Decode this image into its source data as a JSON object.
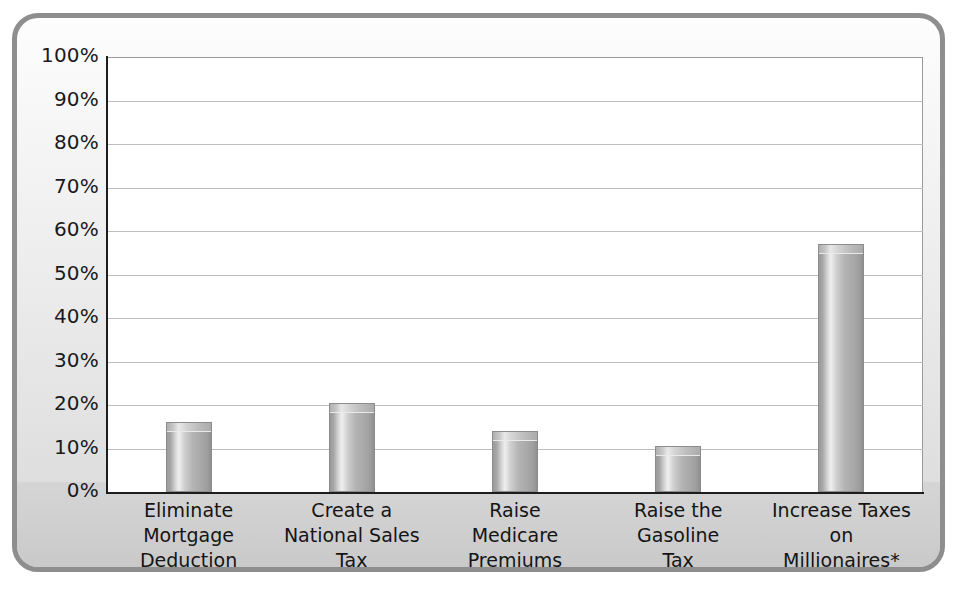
{
  "chart_data": {
    "type": "bar",
    "title": "",
    "subtitle": "",
    "xlabel": "",
    "ylabel": "",
    "ylim": [
      0,
      100
    ],
    "yunit": "%",
    "grid": true,
    "legend": "none",
    "orientation": "vertical",
    "categories": [
      "Eliminate Mortgage Deduction",
      "Create a National Sales Tax",
      "Raise Medicare Premiums",
      "Raise the Gasoline Tax",
      "Increase Taxes on Millionaires*"
    ],
    "category_lines": [
      [
        "Eliminate",
        "Mortgage",
        "Deduction"
      ],
      [
        "Create a",
        "National Sales",
        "Tax"
      ],
      [
        "Raise",
        "Medicare",
        "Premiums"
      ],
      [
        "Raise the",
        "Gasoline",
        "Tax"
      ],
      [
        "Increase Taxes",
        "on",
        "Millionaires*"
      ]
    ],
    "values": [
      16,
      20.5,
      14,
      10.5,
      57
    ],
    "yticks": [
      0,
      10,
      20,
      30,
      40,
      50,
      60,
      70,
      80,
      90,
      100
    ],
    "ytick_labels": [
      "0%",
      "10%",
      "20%",
      "30%",
      "40%",
      "50%",
      "60%",
      "70%",
      "80%",
      "90%",
      "100%"
    ],
    "bar_color": "#b4b4b4",
    "gridline_color": "#bdbdbd",
    "axis_color": "#1d1d1d",
    "plot_background": "#ffffff",
    "frame_color": "#8e8e8e",
    "label_band_color": "#d0d0d0"
  }
}
